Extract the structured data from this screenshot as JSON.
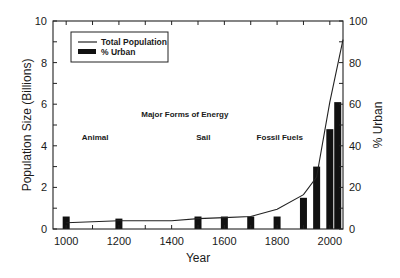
{
  "chart_data": {
    "type": "bar+line",
    "title": "",
    "xlabel": "Year",
    "ylabel": "Population Size (Billions)",
    "ylabel_right": "% Urban",
    "xlim": [
      950,
      2050
    ],
    "ylim": [
      0,
      10
    ],
    "ylim_right": [
      0,
      100
    ],
    "x_ticks": [
      1000,
      1200,
      1400,
      1600,
      1800,
      2000
    ],
    "x_minor_ticks_step": 100,
    "y_ticks": [
      0,
      2,
      4,
      6,
      8,
      10
    ],
    "y_right_ticks": [
      0,
      20,
      40,
      60,
      80,
      100
    ],
    "grid": false,
    "legend_position": "upper left",
    "legend": [
      {
        "label": "Total Population",
        "type": "line"
      },
      {
        "label": "% Urban",
        "type": "bar"
      }
    ],
    "series": [
      {
        "name": "Total Population",
        "type": "line",
        "axis": "left",
        "x": [
          1000,
          1200,
          1400,
          1500,
          1600,
          1700,
          1800,
          1900,
          1950,
          2000,
          2050
        ],
        "values": [
          0.3,
          0.4,
          0.4,
          0.5,
          0.55,
          0.6,
          0.95,
          1.65,
          2.5,
          6.1,
          9.1
        ]
      },
      {
        "name": "% Urban",
        "type": "bar",
        "axis": "right",
        "x": [
          1000,
          1200,
          1500,
          1600,
          1700,
          1800,
          1900,
          1950,
          2000,
          2030
        ],
        "values": [
          6,
          5,
          6,
          6,
          6,
          6,
          15,
          30,
          48,
          61
        ]
      }
    ],
    "annotations": [
      {
        "text": "Major Forms of Energy",
        "x": 1450,
        "y": 5.4
      },
      {
        "text": "Animal",
        "x": 1110,
        "y": 4.3
      },
      {
        "text": "Sail",
        "x": 1520,
        "y": 4.3
      },
      {
        "text": "Fossil Fuels",
        "x": 1810,
        "y": 4.3
      }
    ]
  }
}
